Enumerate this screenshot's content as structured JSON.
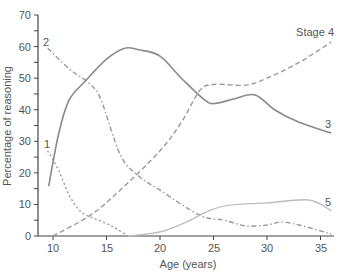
{
  "chart_data": {
    "type": "line",
    "title": "",
    "xlabel": "Age (years)",
    "ylabel": "Percentage of reasoning",
    "xlim": [
      9,
      36.2
    ],
    "ylim": [
      0,
      70
    ],
    "xticks": [
      10,
      15,
      20,
      25,
      30,
      35
    ],
    "yticks": [
      0,
      10,
      20,
      30,
      40,
      50,
      60,
      70
    ],
    "grid": false,
    "legend": "inline labels at line ends",
    "series": [
      {
        "name": "1",
        "label": "1",
        "style": "dotted",
        "color": "#9a9a9a",
        "x": [
          9.5,
          10.5,
          11.5,
          12.5,
          13.5,
          15.3,
          17
        ],
        "values": [
          27,
          21,
          13,
          8,
          6,
          3.5,
          0
        ]
      },
      {
        "name": "2",
        "label": "2",
        "style": "dash-dot",
        "color": "#9a9a9a",
        "x": [
          9.5,
          11.5,
          13.5,
          14.5,
          16.3,
          18,
          20,
          23.7,
          26,
          28,
          30,
          31.3,
          33,
          36
        ],
        "values": [
          59.5,
          53,
          48,
          43,
          25.6,
          19,
          14.5,
          6.6,
          5,
          3.2,
          3.5,
          4.4,
          3.5,
          0.6
        ]
      },
      {
        "name": "3",
        "label": "3",
        "style": "solid",
        "color": "#8a8a8a",
        "x": [
          9.6,
          10.5,
          11.5,
          13,
          15,
          16.7,
          18,
          20,
          22,
          24.2,
          25.2,
          27,
          28.9,
          30.7,
          33,
          36
        ],
        "values": [
          15.8,
          32,
          43,
          49,
          56,
          59.5,
          59,
          57,
          50,
          43,
          42,
          43.5,
          44.7,
          40,
          36,
          32.6
        ]
      },
      {
        "name": "Stage 4",
        "label": "Stage 4",
        "style": "dashed",
        "color": "#9a9a9a",
        "x": [
          10,
          13.5,
          16.3,
          20,
          22,
          23.7,
          25,
          28,
          30,
          33,
          36
        ],
        "values": [
          0,
          6.6,
          14.6,
          27,
          36,
          46,
          48,
          47.8,
          50,
          55,
          61.4
        ]
      },
      {
        "name": "5",
        "label": "5",
        "style": "solid-light",
        "color": "#bdbdbd",
        "x": [
          17,
          20,
          22.5,
          24.7,
          26.5,
          30,
          33.9,
          36
        ],
        "values": [
          0,
          1.3,
          4.5,
          8.2,
          9.8,
          10.5,
          11.4,
          8
        ]
      }
    ]
  },
  "labels": {
    "xlabel": "Age (years)",
    "ylabel": "Percentage of reasoning",
    "series_1": "1",
    "series_2": "2",
    "series_3": "3",
    "series_4": "Stage 4",
    "series_5": "5",
    "xtick_10": "10",
    "xtick_15": "15",
    "xtick_20": "20",
    "xtick_25": "25",
    "xtick_30": "30",
    "xtick_35": "35",
    "ytick_0": "0",
    "ytick_10": "10",
    "ytick_20": "20",
    "ytick_30": "30",
    "ytick_40": "40",
    "ytick_50": "50",
    "ytick_60": "60",
    "ytick_70": "70"
  }
}
